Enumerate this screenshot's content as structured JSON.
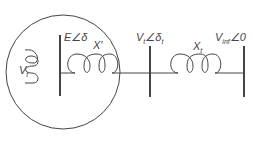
{
  "diagram": {
    "type": "single-machine infinite-bus circuit",
    "colors": {
      "stroke": "#444444",
      "background": "#ffffff"
    },
    "labels": {
      "terminal_voltage": "V",
      "terminal_voltage_sub": "t",
      "internal_emf": "E∠δ",
      "transient_reactance": "X'",
      "bus_voltage": "V",
      "bus_voltage_sub": "t",
      "bus_angle": "∠δ",
      "bus_angle_sub": "t",
      "transformer_reactance": "X",
      "transformer_reactance_sub": "t",
      "infinite_bus": "V",
      "infinite_bus_sub": "inf",
      "infinite_bus_angle": "∠0"
    }
  }
}
